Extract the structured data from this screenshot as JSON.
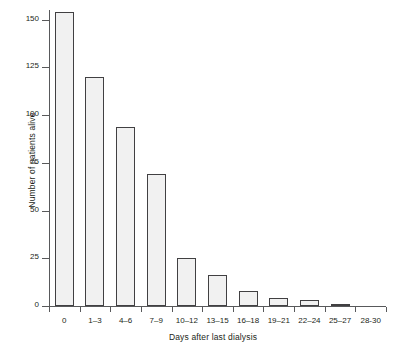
{
  "chart_data": {
    "type": "bar",
    "title": "",
    "xlabel": "Days after last dialysis",
    "ylabel": "Number of patients alive",
    "categories": [
      "0",
      "1–3",
      "4–6",
      "7–9",
      "10–12",
      "13–15",
      "16–18",
      "19–21",
      "22–24",
      "25–27",
      "28-30"
    ],
    "values": [
      154,
      120,
      94,
      69,
      25,
      16,
      8,
      4,
      3,
      1,
      0
    ],
    "ylim": [
      0,
      160
    ],
    "yticks": [
      0,
      25,
      50,
      75,
      100,
      125,
      150
    ],
    "ytick_labels": [
      "0",
      "25",
      "50",
      "75",
      "100",
      "125",
      "150"
    ],
    "grid": false,
    "legend": "none",
    "colors": {
      "bar_fill": "#f1f1f1",
      "bar_edge": "#414042",
      "axis": "#58595b",
      "text": "#231f20",
      "background": "#ffffff"
    }
  }
}
